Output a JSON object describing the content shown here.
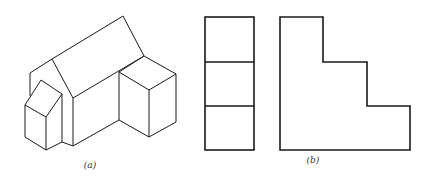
{
  "figure": {
    "panels": [
      {
        "id": "a",
        "label": "(a)",
        "description": "Isometric pictorial of a house-like solid with gabled roof, a small pentagonal-front wing on the left and a rectangular box on the right"
      },
      {
        "id": "b",
        "label": "(b)",
        "description": "Orthographic views: a tall rectangle divided into three equal stacked squares, and an L-shaped stepped outline with two steps"
      }
    ],
    "colors": {
      "line": "#1a1a1a",
      "background": "#ffffff",
      "label": "#333333"
    }
  }
}
